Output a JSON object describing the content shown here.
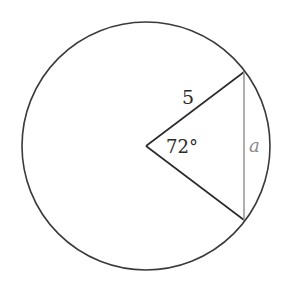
{
  "diagram": {
    "type": "circle-sector-chord",
    "circle": {
      "cx": 146,
      "cy": 146,
      "r": 124,
      "stroke": "#3a3a3a"
    },
    "vertex": {
      "x": 146,
      "y": 146
    },
    "chord_endpoints": [
      {
        "x": 244,
        "y": 72
      },
      {
        "x": 244,
        "y": 220
      }
    ],
    "chord_color": "#9a9a9a",
    "radius_label": "5",
    "angle_label": "72°",
    "chord_label": "a"
  }
}
